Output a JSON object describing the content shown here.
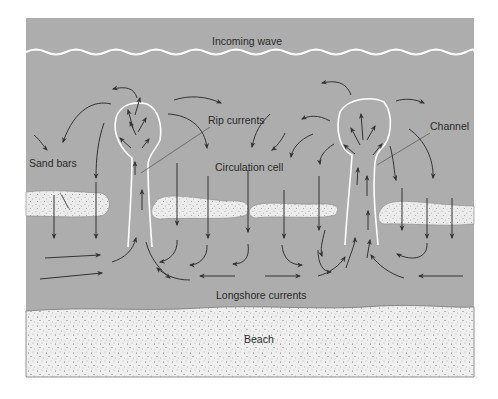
{
  "diagram": {
    "labels": {
      "incoming_wave": "Incoming wave",
      "rip_currents": "Rip currents",
      "channel": "Channel",
      "sand_bars": "Sand bars",
      "circulation_cell": "Circulation cell",
      "longshore_currents": "Longshore currents",
      "beach": "Beach"
    },
    "colors": {
      "water": "#adadad",
      "sand": "#efefef",
      "arrow": "#333333",
      "channel_outline": "#ffffff",
      "leader_line": "#555555"
    },
    "regions": [
      "ocean-water",
      "incoming-wave-line",
      "sand-bars",
      "rip-channels",
      "beach"
    ],
    "rip_channel_count": 2,
    "sand_bar_count": 4
  }
}
